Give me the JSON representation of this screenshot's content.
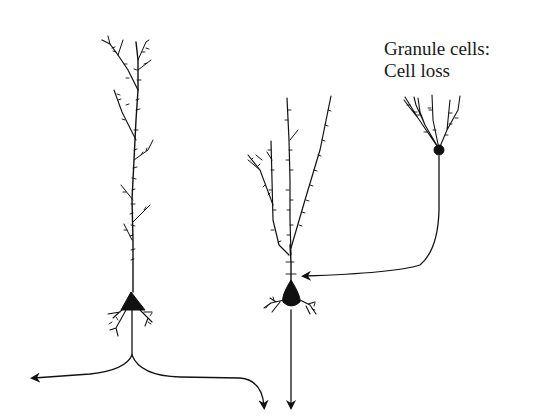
{
  "diagram": {
    "label": {
      "line1": "Granule cells:",
      "line2": "Cell loss"
    },
    "elements": [
      {
        "id": "pyramidal-neuron-left",
        "type": "neuron",
        "soma_shape": "triangle",
        "description": "Tall pyramidal cell with spiny apical dendrite, basal dendrites and bifurcating axon"
      },
      {
        "id": "pyramidal-neuron-middle",
        "type": "neuron",
        "soma_shape": "teardrop",
        "description": "Pyramidal cell with branching spiny apical dendrites and descending axon"
      },
      {
        "id": "granule-cell",
        "type": "neuron",
        "soma_shape": "circle",
        "description": "Granule cell with fan of spiny dendrites and curved axon projecting to middle neuron"
      }
    ],
    "arrows": [
      {
        "from": "pyramidal-neuron-left",
        "direction": "left"
      },
      {
        "from": "pyramidal-neuron-left",
        "direction": "down"
      },
      {
        "from": "pyramidal-neuron-middle",
        "direction": "down"
      },
      {
        "from": "granule-cell",
        "to": "pyramidal-neuron-middle",
        "direction": "left"
      }
    ],
    "colors": {
      "ink": "#111111",
      "background": "#ffffff"
    }
  }
}
